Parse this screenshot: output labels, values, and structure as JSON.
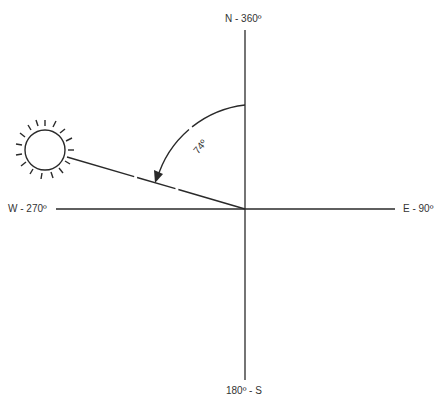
{
  "diagram": {
    "type": "compass-azimuth",
    "labels": {
      "north": "N - 360º",
      "east": "E - 90º",
      "south": "180º - S",
      "west": "W - 270º",
      "angle": "74º"
    },
    "sun_azimuth_deg": 286,
    "angle_from_north_deg": 74,
    "colors": {
      "line": "#2a2a2a",
      "background": "#ffffff"
    }
  }
}
